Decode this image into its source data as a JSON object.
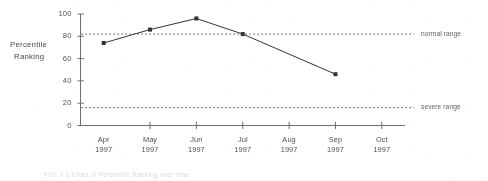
{
  "chart_data": {
    "type": "line",
    "title": "",
    "xlabel": "",
    "ylabel": "Percentile Ranking",
    "ylabel_lines": [
      "Percentile",
      "Ranking"
    ],
    "categories": [
      "Apr 1997",
      "May 1997",
      "Jun 1997",
      "Jul 1997",
      "Aug 1997",
      "Sep 1997",
      "Oct 1997"
    ],
    "x_tick_lines": [
      {
        "month": "Apr",
        "year": "1997"
      },
      {
        "month": "May",
        "year": "1997"
      },
      {
        "month": "Jun",
        "year": "1997"
      },
      {
        "month": "Jul",
        "year": "1997"
      },
      {
        "month": "Aug",
        "year": "1997"
      },
      {
        "month": "Sep",
        "year": "1997"
      },
      {
        "month": "Oct",
        "year": "1997"
      }
    ],
    "series": [
      {
        "name": "Percentile Ranking",
        "values": [
          74,
          86,
          96,
          82,
          null,
          46,
          null
        ],
        "marker": "square",
        "color": "#2b2b2b"
      }
    ],
    "ylim": [
      0,
      100
    ],
    "y_ticks": [
      0,
      20,
      40,
      60,
      80,
      100
    ],
    "y_tick_labels": [
      "0",
      "20",
      "40",
      "60",
      "80",
      "100"
    ],
    "grid": false,
    "legend_position": "right-inline",
    "reference_lines": [
      {
        "label": "normal range",
        "value": 82,
        "style": "dotted",
        "color": "#3a3a3a"
      },
      {
        "label": "severe range",
        "value": 16,
        "style": "dotted",
        "color": "#3a3a3a"
      }
    ],
    "annotations": []
  },
  "figure": {
    "caption": "FIG. 7.1   Chart of Percentile Ranking over time"
  },
  "colors": {
    "line": "#2b2b2b",
    "axis": "#6a6a6a",
    "text": "#4a4a4a",
    "reference": "#3a3a3a",
    "background": "#ffffff"
  }
}
